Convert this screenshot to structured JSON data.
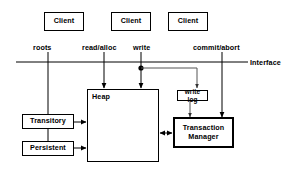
{
  "diagram": {
    "colors": {
      "line": "#000000",
      "thin_line": "#555555",
      "background": "#ffffff",
      "text": "#000000"
    },
    "clients": [
      {
        "label": "Client"
      },
      {
        "label": "Client"
      },
      {
        "label": "Client"
      }
    ],
    "interface_labels": [
      {
        "label": "roots"
      },
      {
        "label": "read/alloc"
      },
      {
        "label": "write"
      },
      {
        "label": "commit/abort"
      }
    ],
    "interface_line_label": "Interface",
    "nodes": {
      "heap": {
        "label": "Heap"
      },
      "write_log": {
        "label": "write log"
      },
      "transaction_manager": {
        "label": "Transaction\nManager",
        "line1": "Transaction",
        "line2": "Manager"
      },
      "transitory": {
        "label": "Transitory"
      },
      "persistent": {
        "label": "Persistent"
      }
    }
  }
}
